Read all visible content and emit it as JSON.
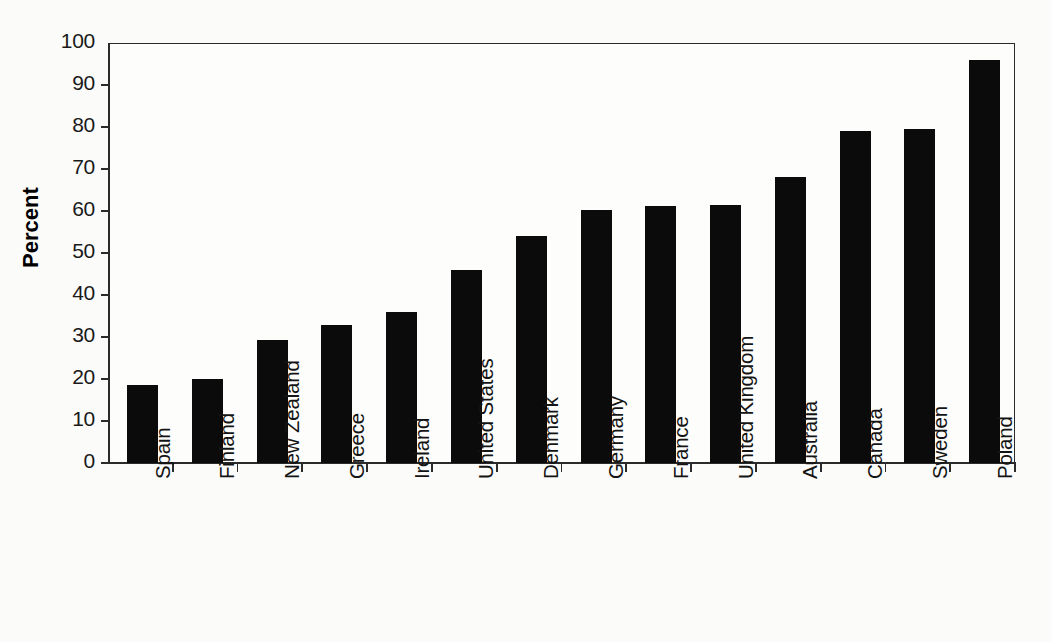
{
  "chart_data": {
    "type": "bar",
    "title": "",
    "subtitle": "",
    "xlabel": "",
    "ylabel": "Percent",
    "ylim": [
      0,
      100
    ],
    "ytick_labels": [
      "100",
      "90",
      "80",
      "70",
      "60",
      "50",
      "40",
      "30",
      "20",
      "10",
      "0"
    ],
    "ytick_values": [
      100,
      90,
      80,
      70,
      60,
      50,
      40,
      30,
      20,
      10,
      0
    ],
    "grid": false,
    "legend": null,
    "legend_position": "none",
    "bar_color": "#0b0b0b",
    "axis_color": "#2b2b2b",
    "categories": [
      "Spain",
      "Finland",
      "New Zealand",
      "Greece",
      "Ireland",
      "United States",
      "Denmark",
      "Germany",
      "France",
      "United Kingdom",
      "Australia",
      "Canada",
      "Sweden",
      "Poland"
    ],
    "values": [
      18.5,
      19.9,
      29.4,
      32.9,
      36.0,
      46.0,
      54.0,
      60.3,
      61.3,
      61.4,
      68.2,
      79.1,
      79.5,
      96.0
    ],
    "xtick_label_rotation": -90
  }
}
